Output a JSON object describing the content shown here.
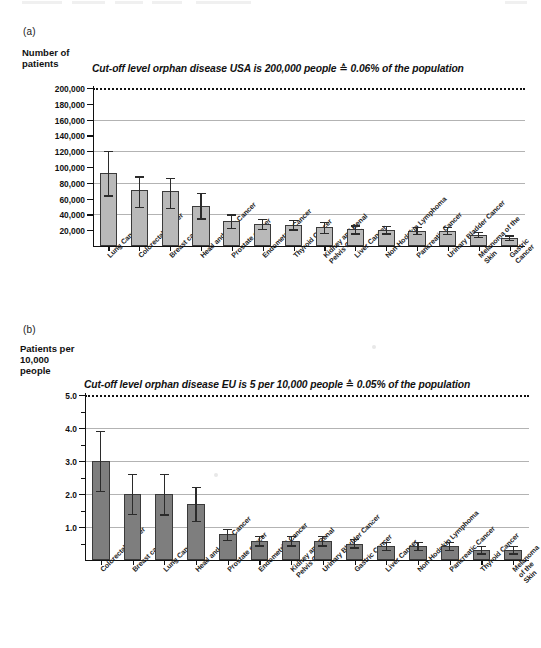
{
  "figure": {
    "panel_a_letter": "(a)",
    "panel_b_letter": "(b)"
  },
  "panel_a": {
    "axis_title": "Number of\npatients",
    "cutoff_label": "Cut-off level orphan disease USA is 200,000 people ≙ 0.06% of the population",
    "ytick_labels": [
      "200,000",
      "180,000",
      "160,000",
      "140,000",
      "120,000",
      "100,000",
      "80,000",
      "60,000",
      "40,000",
      "20,000"
    ]
  },
  "panel_b": {
    "axis_title": "Patients per\n10,000\npeople",
    "cutoff_label": "Cut-off level orphan disease EU is 5 per 10,000 people ≙ 0.05% of the population",
    "ytick_labels": [
      "5.0",
      "4.0",
      "3.0",
      "2.0",
      "1.0"
    ]
  },
  "chart_data": [
    {
      "type": "bar",
      "panel": "(a)",
      "title": "Cut-off level orphan disease USA is 200,000 people ≙ 0.06% of the population",
      "xlabel": "",
      "ylabel": "Number of patients",
      "ylim": [
        0,
        200000
      ],
      "ytick_values": [
        20000,
        40000,
        60000,
        80000,
        100000,
        120000,
        140000,
        160000,
        180000,
        200000
      ],
      "gridlines": [
        40000,
        80000,
        120000,
        160000
      ],
      "grid": true,
      "legend": "none",
      "bar_color": "#b9b9b9",
      "cutoff_line": 200000,
      "categories": [
        "Lung Cancer",
        "Colorectal Cancer",
        "Breast cancer",
        "Head and neck Cancer",
        "Prostate cancer",
        "Endometrial Cancer",
        "Thyroid Cancer",
        "Kidney and Renal\nPelvis Cancer",
        "Liver Cancer",
        "Non-Hodgkin Lymphoma",
        "Pancreatic Cancer",
        "Urinary Bladder Cancer",
        "Melanoma of the Skin",
        "Gastric Cancer"
      ],
      "values": [
        92000,
        71000,
        70000,
        51000,
        31500,
        28000,
        27000,
        24500,
        21000,
        20500,
        19500,
        19000,
        14000,
        10500
      ],
      "err_low": [
        64000,
        49000,
        48000,
        35000,
        23000,
        22000,
        21000,
        17000,
        16000,
        16000,
        15500,
        15000,
        11000,
        8000
      ],
      "err_high": [
        120000,
        88000,
        86000,
        67000,
        40000,
        34000,
        33000,
        31000,
        26000,
        25500,
        24500,
        24000,
        18000,
        13500
      ]
    },
    {
      "type": "bar",
      "panel": "(b)",
      "title": "Cut-off level orphan disease EU is 5 per 10,000 people ≙ 0.05% of the population",
      "xlabel": "",
      "ylabel": "Patients per 10,000 people",
      "ylim": [
        0,
        5.0
      ],
      "ytick_values": [
        1.0,
        2.0,
        3.0,
        4.0,
        5.0
      ],
      "minor_ytick_values": [
        0.5,
        1.5,
        2.5,
        3.5,
        4.5
      ],
      "gridlines": [
        1.0,
        2.0,
        3.0,
        4.0
      ],
      "grid": true,
      "legend": "none",
      "bar_color": "#7e7e7e",
      "cutoff_line": 5.0,
      "categories": [
        "Colorectal Cancer",
        "Breast cancer",
        "Lung Cancer",
        "Head and neck Cancer",
        "Prostate cancer",
        "Endometrial Cancer",
        "Kidney and Renal\nPelvis Cancer",
        "Urinary Bladder Cancer",
        "Gastric Cancer",
        "Liver Cancer",
        "Non-Hodgkin Lymphoma",
        "Pancreatic Cancer",
        "Thyroid Cancer",
        "Melanoma of the Skin"
      ],
      "values": [
        3.0,
        2.0,
        2.0,
        1.7,
        0.78,
        0.58,
        0.57,
        0.57,
        0.5,
        0.42,
        0.42,
        0.42,
        0.3,
        0.3
      ],
      "err_low": [
        2.1,
        1.4,
        1.38,
        1.18,
        0.62,
        0.44,
        0.44,
        0.44,
        0.38,
        0.31,
        0.31,
        0.31,
        0.2,
        0.2
      ],
      "err_high": [
        3.92,
        2.62,
        2.6,
        2.22,
        0.95,
        0.72,
        0.72,
        0.72,
        0.64,
        0.55,
        0.55,
        0.55,
        0.42,
        0.42
      ]
    }
  ]
}
